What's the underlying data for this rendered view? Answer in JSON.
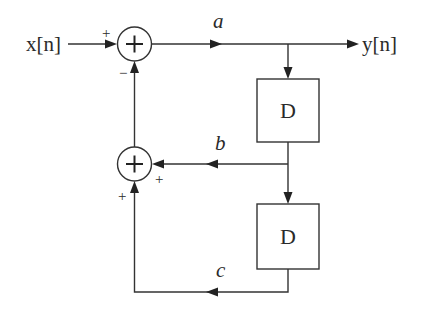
{
  "diagram": {
    "type": "signal-flow block diagram",
    "input": {
      "label": "x[n]"
    },
    "output": {
      "label": "y[n]"
    },
    "summers": [
      {
        "id": "sum-top",
        "symbol": "+",
        "input_signs": {
          "left": "+",
          "bottom": "−"
        }
      },
      {
        "id": "sum-feedback",
        "symbol": "+",
        "input_signs": {
          "right": "+",
          "bottom": "+"
        }
      }
    ],
    "blocks": [
      {
        "id": "delay-1",
        "label": "D"
      },
      {
        "id": "delay-2",
        "label": "D"
      }
    ],
    "signals": [
      {
        "id": "a",
        "label": "a"
      },
      {
        "id": "b",
        "label": "b"
      },
      {
        "id": "c",
        "label": "c"
      }
    ],
    "connections": [
      {
        "from": "x[n]",
        "to": "sum-top",
        "sign": "+"
      },
      {
        "from": "sum-top",
        "to": "y[n]",
        "signal": "a"
      },
      {
        "from": "a",
        "to": "delay-1"
      },
      {
        "from": "delay-1",
        "to": "sum-feedback",
        "signal": "b",
        "sign": "+"
      },
      {
        "from": "delay-1",
        "to": "delay-2"
      },
      {
        "from": "delay-2",
        "to": "sum-feedback",
        "signal": "c",
        "sign": "+"
      },
      {
        "from": "sum-feedback",
        "to": "sum-top",
        "sign": "−"
      }
    ]
  }
}
